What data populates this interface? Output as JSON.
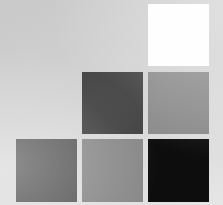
{
  "layout": {
    "background": "#d0d0d0",
    "grid": {
      "columns": 3,
      "rows": 3,
      "arrangement": "staircase"
    }
  },
  "swatches": [
    {
      "id": "r1c3",
      "row": 1,
      "col": 3,
      "color": "#fefefe",
      "tone": "white",
      "x": 148,
      "y": 4,
      "w": 61,
      "h": 62
    },
    {
      "id": "r2c2",
      "row": 2,
      "col": 2,
      "color": "#3f3f3f",
      "tone": "dark-gray",
      "x": 82,
      "y": 72,
      "w": 61,
      "h": 62
    },
    {
      "id": "r2c3",
      "row": 2,
      "col": 3,
      "color": "#8a8a8a",
      "tone": "medium-gray",
      "x": 148,
      "y": 72,
      "w": 61,
      "h": 62
    },
    {
      "id": "r3c1",
      "row": 3,
      "col": 1,
      "color": "#555555",
      "tone": "dark-gray",
      "x": 16,
      "y": 139,
      "w": 61,
      "h": 63
    },
    {
      "id": "r3c2",
      "row": 3,
      "col": 2,
      "color": "#878787",
      "tone": "medium-gray",
      "x": 82,
      "y": 139,
      "w": 61,
      "h": 63
    },
    {
      "id": "r3c3",
      "row": 3,
      "col": 3,
      "color": "#0d0d0d",
      "tone": "black",
      "x": 148,
      "y": 139,
      "w": 61,
      "h": 63
    }
  ]
}
